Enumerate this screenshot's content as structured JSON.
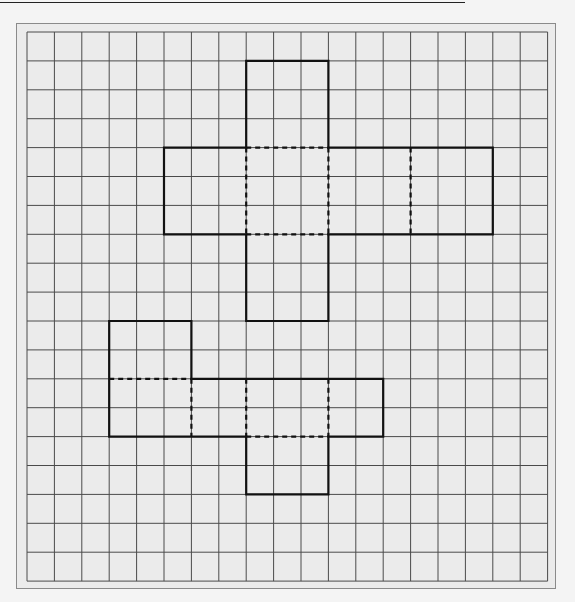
{
  "header": {
    "clipped_heading": ""
  },
  "grid": {
    "origin_x": 27,
    "origin_y": 32,
    "cols": 19,
    "rows": 19,
    "cell_width": 27.4,
    "cell_height": 28.9,
    "line_color": "#4a4a4a",
    "background_color": "#ebebeb",
    "frame_color": "#8a8a8a"
  },
  "nets": [
    {
      "name": "cross-net-upper",
      "outline": [
        [
          8,
          1
        ],
        [
          11,
          1
        ],
        [
          11,
          4
        ],
        [
          17,
          4
        ],
        [
          17,
          7
        ],
        [
          11,
          7
        ],
        [
          11,
          10
        ],
        [
          8,
          10
        ],
        [
          8,
          7
        ],
        [
          5,
          7
        ],
        [
          5,
          4
        ],
        [
          8,
          4
        ]
      ],
      "fold_lines": [
        [
          [
            8,
            4
          ],
          [
            11,
            4
          ]
        ],
        [
          [
            8,
            7
          ],
          [
            11,
            7
          ]
        ],
        [
          [
            8,
            4
          ],
          [
            8,
            7
          ]
        ],
        [
          [
            11,
            4
          ],
          [
            11,
            7
          ]
        ],
        [
          [
            14,
            4
          ],
          [
            14,
            7
          ]
        ]
      ]
    },
    {
      "name": "net-lower",
      "outline": [
        [
          3,
          10
        ],
        [
          6,
          10
        ],
        [
          6,
          12
        ],
        [
          13,
          12
        ],
        [
          13,
          14
        ],
        [
          11,
          14
        ],
        [
          11,
          16
        ],
        [
          8,
          16
        ],
        [
          8,
          14
        ],
        [
          3,
          14
        ]
      ],
      "fold_lines": [
        [
          [
            3,
            12
          ],
          [
            6,
            12
          ]
        ],
        [
          [
            6,
            12
          ],
          [
            6,
            14
          ]
        ],
        [
          [
            8,
            12
          ],
          [
            8,
            14
          ]
        ],
        [
          [
            11,
            12
          ],
          [
            11,
            14
          ]
        ],
        [
          [
            8,
            14
          ],
          [
            11,
            14
          ]
        ]
      ]
    }
  ],
  "style": {
    "outline_color": "#111111",
    "outline_width": 2.2,
    "fold_color": "#111111",
    "fold_width": 2.2,
    "fold_dash": "5,4"
  }
}
